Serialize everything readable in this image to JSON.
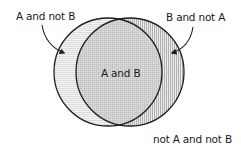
{
  "diagram": {
    "type": "venn",
    "sets": [
      {
        "id": "A",
        "position": "left"
      },
      {
        "id": "B",
        "position": "right"
      }
    ],
    "regions": {
      "a_only": {
        "label": "A and not B",
        "pattern": "horizontal-lines"
      },
      "b_only": {
        "label": "B and not A",
        "pattern": "vertical-lines"
      },
      "a_and_b": {
        "label": "A and B",
        "pattern": "grid"
      },
      "neither": {
        "label": "not A and not B",
        "pattern": "none"
      }
    },
    "colors": {
      "outline": "#1f1f1f",
      "text": "#1a1a1a",
      "a_only_bg": "#f4f4f4",
      "a_only_line": "#d6d6d6",
      "a_and_b_bg": "#e2e2e2",
      "a_and_b_line": "#b9b9b9",
      "b_only_bg": "#ececec",
      "b_only_line": "#a9a9a9"
    }
  }
}
